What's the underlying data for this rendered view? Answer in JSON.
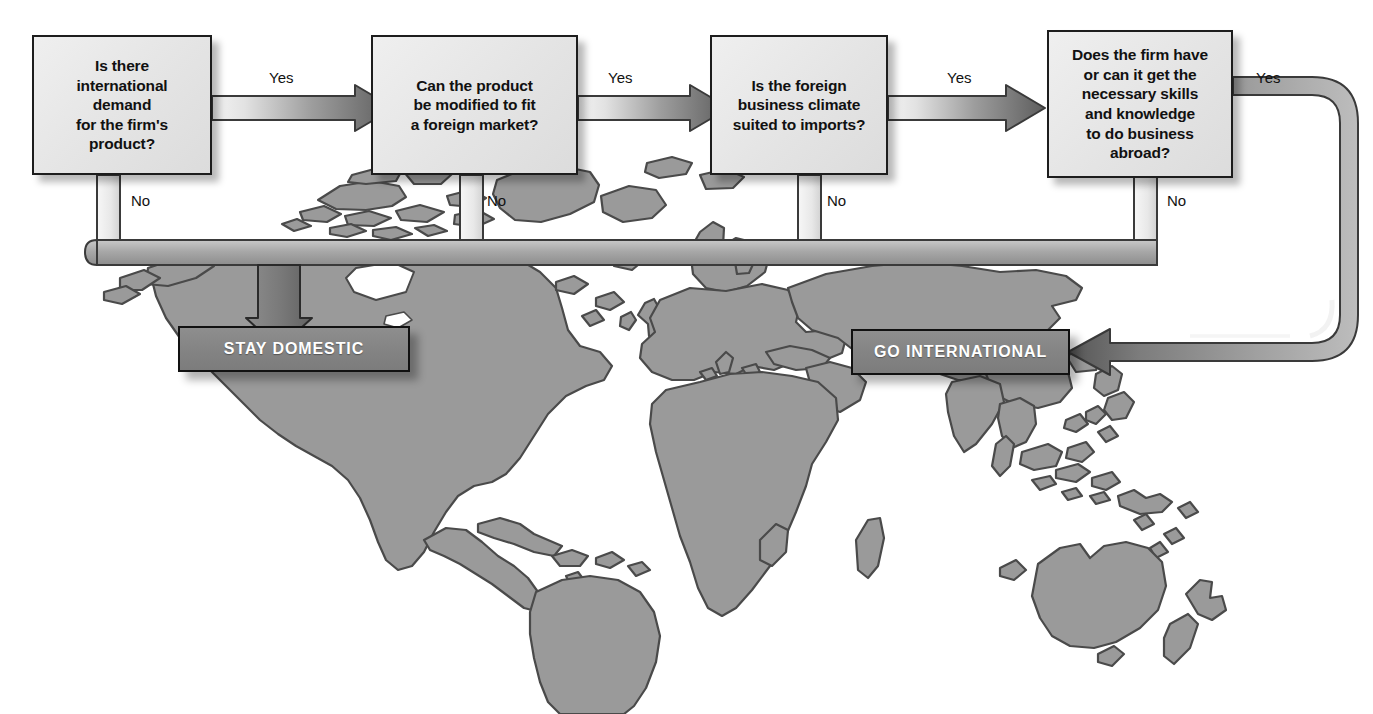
{
  "diagram": {
    "background": "world-map",
    "colors": {
      "box_fill": "#e6e6e6",
      "box_border": "#1d1d1d",
      "terminal_fill": "#848484",
      "terminal_text": "#ffffff",
      "connector_light": "#f2f2f2",
      "connector_dark": "#5f5f5f",
      "map_land": "#9a9a9a",
      "map_outline": "#4a4a4a",
      "page_background": "#ffffff"
    },
    "decisions": [
      {
        "id": "d1",
        "lines": [
          "Is there",
          "international",
          "demand",
          "for the firm's",
          "product?"
        ]
      },
      {
        "id": "d2",
        "lines": [
          "Can the product",
          "be modified to fit",
          "a foreign market?"
        ]
      },
      {
        "id": "d3",
        "lines": [
          "Is the foreign",
          "business climate",
          "suited to imports?"
        ]
      },
      {
        "id": "d4",
        "lines": [
          "Does the firm have",
          "or can it get the",
          "necessary skills",
          "and knowledge",
          "to do business",
          "abroad?"
        ]
      }
    ],
    "terminals": [
      {
        "id": "t_stay",
        "label": "STAY DOMESTIC"
      },
      {
        "id": "t_go",
        "label": "GO INTERNATIONAL"
      }
    ],
    "edge_labels": {
      "yes1": "Yes",
      "yes2": "Yes",
      "yes3": "Yes",
      "yes4": "Yes",
      "no1": "No",
      "no2": "No",
      "no3": "No",
      "no4": "No"
    },
    "flow": [
      {
        "from": "d1",
        "answer": "Yes",
        "to": "d2"
      },
      {
        "from": "d2",
        "answer": "Yes",
        "to": "d3"
      },
      {
        "from": "d3",
        "answer": "Yes",
        "to": "d4"
      },
      {
        "from": "d4",
        "answer": "Yes",
        "to": "t_go"
      },
      {
        "from": "d1",
        "answer": "No",
        "to": "t_stay"
      },
      {
        "from": "d2",
        "answer": "No",
        "to": "t_stay"
      },
      {
        "from": "d3",
        "answer": "No",
        "to": "t_stay"
      },
      {
        "from": "d4",
        "answer": "No",
        "to": "t_stay"
      }
    ]
  }
}
